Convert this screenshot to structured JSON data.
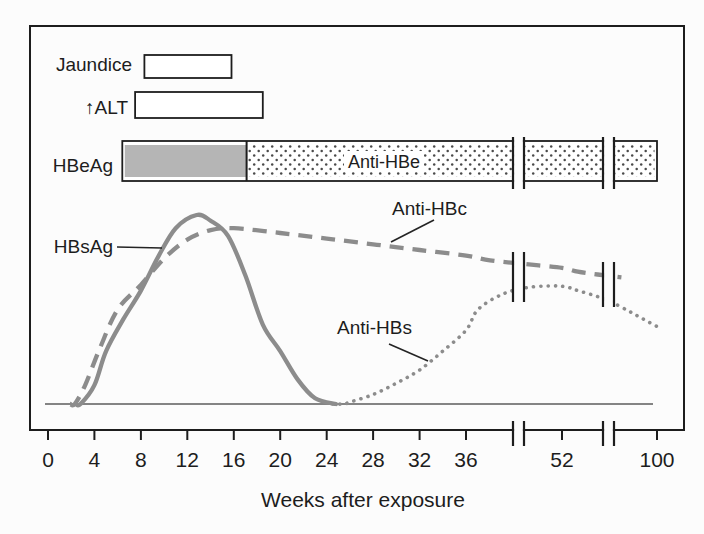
{
  "figure": {
    "row_labels": {
      "jaundice": "Jaundice",
      "alt_arrow": "↑",
      "alt": "ALT",
      "hbeag": "HBeAg"
    },
    "annotations": {
      "anti_hbe": "Anti-HBe",
      "anti_hbc": "Anti-HBc",
      "anti_hbs": "Anti-HBs",
      "hbsag": "HBsAg"
    },
    "xlabel": "Weeks after exposure",
    "colors": {
      "curve": "#8c8c8c",
      "bar_fill": "#b5b5b5",
      "ink": "#1d1d1d",
      "background": "#fcfcfc"
    }
  },
  "chart_data": {
    "type": "line",
    "xlabel": "Weeks after exposure",
    "ylabel": "",
    "y_unit": "relative level (no y-axis shown)",
    "ylim": [
      0,
      1
    ],
    "x_ticks": [
      0,
      4,
      8,
      12,
      16,
      20,
      24,
      28,
      32,
      36,
      52,
      100
    ],
    "x_axis_breaks": [
      {
        "between_ticks": [
          36,
          52
        ]
      },
      {
        "between_ticks": [
          52,
          100
        ]
      }
    ],
    "timeline_bars": [
      {
        "label": "Jaundice",
        "start_week": 8.3,
        "end_week": 15.8,
        "style": "outline"
      },
      {
        "label": "ALT",
        "start_week": 7.5,
        "end_week": 18.5,
        "style": "outline"
      },
      {
        "label": "HBeAg",
        "start_week": 6.4,
        "end_week": 17.1,
        "style": "solid-gray"
      },
      {
        "label": "Anti-HBe",
        "start_week": 17.1,
        "end_week": 100,
        "style": "stippled"
      }
    ],
    "series": [
      {
        "name": "HBsAg",
        "line_style": "solid",
        "points": [
          [
            2.4,
            0
          ],
          [
            2.8,
            0
          ],
          [
            4,
            0.1
          ],
          [
            5,
            0.28
          ],
          [
            6.5,
            0.45
          ],
          [
            8,
            0.6
          ],
          [
            9.5,
            0.78
          ],
          [
            11,
            0.93
          ],
          [
            12.8,
            1
          ],
          [
            14,
            0.97
          ],
          [
            15.5,
            0.89
          ],
          [
            17,
            0.68
          ],
          [
            18.5,
            0.42
          ],
          [
            20,
            0.28
          ],
          [
            21.5,
            0.13
          ],
          [
            23,
            0.03
          ],
          [
            24.8,
            0
          ]
        ]
      },
      {
        "name": "Anti-HBc",
        "line_style": "dashed",
        "points": [
          [
            1.9,
            0
          ],
          [
            2.3,
            0
          ],
          [
            3.2,
            0.1
          ],
          [
            4.5,
            0.3
          ],
          [
            6,
            0.5
          ],
          [
            8,
            0.63
          ],
          [
            10,
            0.77
          ],
          [
            12,
            0.87
          ],
          [
            14,
            0.92
          ],
          [
            16,
            0.93
          ],
          [
            20,
            0.905
          ],
          [
            24,
            0.875
          ],
          [
            28,
            0.845
          ],
          [
            32,
            0.815
          ],
          [
            36,
            0.785
          ],
          [
            40,
            0.76
          ],
          [
            46,
            0.74
          ],
          [
            52,
            0.72
          ],
          [
            60,
            0.7
          ],
          [
            70,
            0.685
          ],
          [
            82,
            0.67
          ]
        ]
      },
      {
        "name": "Anti-HBs",
        "line_style": "dotted",
        "points": [
          [
            24.5,
            0
          ],
          [
            25.5,
            0
          ],
          [
            26,
            0.01
          ],
          [
            28,
            0.05
          ],
          [
            30,
            0.11
          ],
          [
            32,
            0.18
          ],
          [
            34,
            0.28
          ],
          [
            36,
            0.39
          ],
          [
            38,
            0.5
          ],
          [
            42,
            0.58
          ],
          [
            46,
            0.615
          ],
          [
            50,
            0.625
          ],
          [
            54,
            0.62
          ],
          [
            60,
            0.6
          ],
          [
            68,
            0.575
          ],
          [
            76,
            0.545
          ],
          [
            86,
            0.49
          ],
          [
            93,
            0.45
          ],
          [
            100,
            0.41
          ]
        ]
      }
    ]
  }
}
